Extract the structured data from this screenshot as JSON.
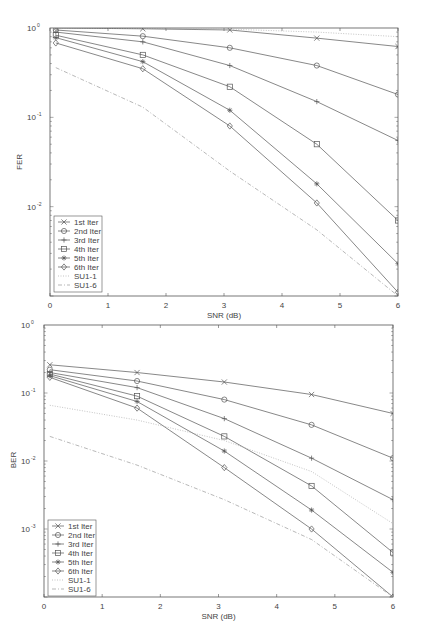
{
  "chart_data": [
    {
      "type": "line",
      "title": "",
      "xlabel": "SNR (dB)",
      "ylabel": "FER",
      "yscale": "log",
      "xlim": [
        0,
        6
      ],
      "ylim": [
        0.001,
        1
      ],
      "xticks": [
        "0",
        "1",
        "2",
        "3",
        "4",
        "5",
        "6"
      ],
      "yticks": [
        "10^0",
        "10^-1",
        "10^-2"
      ],
      "grid": false,
      "legend_position": "lower left",
      "x": [
        0.1,
        1.6,
        3.1,
        4.6,
        6.0
      ],
      "series": [
        {
          "name": "1st Iter",
          "marker": "x",
          "style": "solid",
          "values": [
            1.0,
            0.98,
            0.95,
            0.77,
            0.62
          ]
        },
        {
          "name": "2nd Iter",
          "marker": "o",
          "style": "solid",
          "values": [
            0.95,
            0.81,
            0.6,
            0.38,
            0.18
          ]
        },
        {
          "name": "3rd Iter",
          "marker": "+",
          "style": "solid",
          "values": [
            0.9,
            0.7,
            0.38,
            0.15,
            0.055
          ]
        },
        {
          "name": "4th Iter",
          "marker": "s",
          "style": "solid",
          "values": [
            0.83,
            0.5,
            0.22,
            0.05,
            0.007
          ]
        },
        {
          "name": "5th Iter",
          "marker": "*",
          "style": "solid",
          "values": [
            0.78,
            0.42,
            0.12,
            0.018,
            0.0023
          ]
        },
        {
          "name": "6th Iter",
          "marker": "d",
          "style": "solid",
          "values": [
            0.68,
            0.35,
            0.08,
            0.011,
            0.0011
          ]
        },
        {
          "name": "SU1-1",
          "marker": "",
          "style": "dotted",
          "values": [
            1.0,
            0.99,
            0.97,
            0.9,
            0.8
          ]
        },
        {
          "name": "SU1-6",
          "marker": "",
          "style": "dashdot",
          "values": [
            0.36,
            0.13,
            0.025,
            0.0055,
            0.001
          ]
        }
      ]
    },
    {
      "type": "line",
      "title": "",
      "xlabel": "SNR (dB)",
      "ylabel": "BER",
      "yscale": "log",
      "xlim": [
        0,
        6
      ],
      "ylim": [
        0.0001,
        1
      ],
      "xticks": [
        "0",
        "1",
        "2",
        "3",
        "4",
        "5",
        "6"
      ],
      "yticks": [
        "10^0",
        "10^-1",
        "10^-2",
        "10^-3"
      ],
      "grid": false,
      "legend_position": "lower left",
      "x": [
        0.1,
        1.6,
        3.1,
        4.6,
        6.0
      ],
      "series": [
        {
          "name": "1st Iter",
          "marker": "x",
          "style": "solid",
          "values": [
            0.26,
            0.2,
            0.145,
            0.095,
            0.05
          ]
        },
        {
          "name": "2nd Iter",
          "marker": "o",
          "style": "solid",
          "values": [
            0.22,
            0.15,
            0.08,
            0.034,
            0.011
          ]
        },
        {
          "name": "3rd Iter",
          "marker": "+",
          "style": "solid",
          "values": [
            0.2,
            0.12,
            0.042,
            0.011,
            0.0027
          ]
        },
        {
          "name": "4th Iter",
          "marker": "s",
          "style": "solid",
          "values": [
            0.19,
            0.09,
            0.023,
            0.0043,
            0.00045
          ]
        },
        {
          "name": "5th Iter",
          "marker": "*",
          "style": "solid",
          "values": [
            0.18,
            0.075,
            0.014,
            0.0019,
            0.00023
          ]
        },
        {
          "name": "6th Iter",
          "marker": "d",
          "style": "solid",
          "values": [
            0.17,
            0.06,
            0.008,
            0.001,
            0.0001
          ]
        },
        {
          "name": "SU1-1",
          "marker": "",
          "style": "dotted",
          "values": [
            0.066,
            0.04,
            0.02,
            0.007,
            0.0012
          ]
        },
        {
          "name": "SU1-6",
          "marker": "",
          "style": "dashdot",
          "values": [
            0.023,
            0.0087,
            0.0027,
            0.0007,
            0.0001
          ]
        }
      ]
    }
  ],
  "charts": {
    "top": {
      "ylabel": "FER",
      "xlabel": "SNR (dB)",
      "yticks": [
        {
          "base": "10",
          "exp": "0"
        },
        {
          "base": "10",
          "exp": "-1"
        },
        {
          "base": "10",
          "exp": "-2"
        }
      ],
      "xticks": [
        "0",
        "1",
        "2",
        "3",
        "4",
        "5",
        "6"
      ],
      "legend": [
        "1st Iter",
        "2nd Iter",
        "3rd Iter",
        "4th Iter",
        "5th Iter",
        "6th Iter",
        "SU1-1",
        "SU1-6"
      ]
    },
    "bottom": {
      "ylabel": "BER",
      "xlabel": "SNR (dB)",
      "yticks": [
        {
          "base": "10",
          "exp": "0"
        },
        {
          "base": "10",
          "exp": "-1"
        },
        {
          "base": "10",
          "exp": "-2"
        },
        {
          "base": "10",
          "exp": "-3"
        }
      ],
      "xticks": [
        "0",
        "1",
        "2",
        "3",
        "4",
        "5",
        "6"
      ],
      "legend": [
        "1st Iter",
        "2nd Iter",
        "3rd Iter",
        "4th Iter",
        "5th Iter",
        "6th Iter",
        "SU1-1",
        "SU1-6"
      ]
    }
  },
  "colors": {
    "line": "#555555",
    "axis": "#555555",
    "dotted": "#aaaaaa",
    "dashdot": "#999999"
  }
}
